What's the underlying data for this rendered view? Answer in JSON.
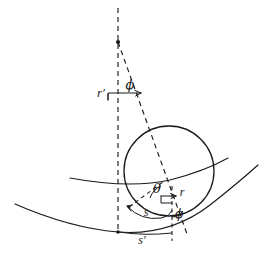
{
  "figure": {
    "background_color": "#ffffff",
    "stroke_color": "#1a1a1a",
    "width": 264,
    "height": 256
  },
  "labels": {
    "r_prime": "r′",
    "phi_upper": "ϕ",
    "theta": "θ",
    "r": "r",
    "phi_lower": "ϕ",
    "s": "s",
    "s_prime": "s′"
  },
  "geometry": {
    "apex_point": {
      "x": 118,
      "y": 42
    },
    "circle": {
      "cx": 169,
      "cy": 171,
      "r": 45
    },
    "vertical_axis": {
      "x": 118,
      "y_top": 8,
      "y_bottom": 233
    },
    "inclined_ray": {
      "x1": 118,
      "y1": 42,
      "x2": 186,
      "y2": 233
    },
    "lower_vertical": {
      "x": 172,
      "y_top": 185,
      "y_bottom": 240
    },
    "upper_arc_label": "upper wavefront arc",
    "lower_arc_label": "lower wavefront arc"
  },
  "label_positions": {
    "r_prime": {
      "x": 101,
      "y": 94
    },
    "phi_upper": {
      "x": 130,
      "y": 86
    },
    "theta": {
      "x": 156,
      "y": 190
    },
    "r": {
      "x": 180,
      "y": 194
    },
    "phi_lower": {
      "x": 178,
      "y": 213
    },
    "s": {
      "x": 146,
      "y": 214
    },
    "s_prime": {
      "x": 141,
      "y": 240
    }
  }
}
